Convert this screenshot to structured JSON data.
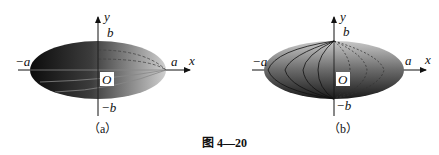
{
  "figure": {
    "caption": "图 4—20",
    "panels": [
      {
        "id": "a",
        "label": "（a）",
        "axis_x": "x",
        "axis_y": "y",
        "origin": "O",
        "pos_a": "a",
        "neg_a": "−a",
        "pos_b": "b",
        "neg_b": "−b",
        "description": "Ellipsoid of revolution about the x-axis, shaded dark-to-light, with horizontal latitude curves (solid front, dashed back)"
      },
      {
        "id": "b",
        "label": "（b）",
        "axis_x": "x",
        "axis_y": "y",
        "origin": "O",
        "pos_a": "a",
        "neg_a": "−a",
        "pos_b": "b",
        "neg_b": "−b",
        "description": "Ellipsoid of revolution about the y-axis, shaded light-to-dark vertically, with vertical meridian curves (solid front, dashed back)"
      }
    ]
  },
  "colors": {
    "dark": "#111111",
    "mid": "#6a6a6a",
    "light": "#cfcfcf",
    "background": "#ffffff"
  }
}
